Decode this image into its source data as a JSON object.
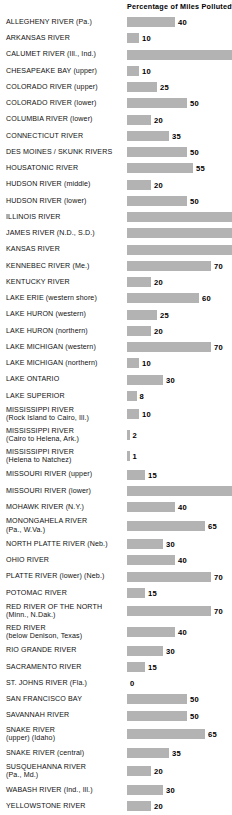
{
  "chart_data": {
    "type": "bar",
    "title": "Percentage of Miles Polluted",
    "title_footnote": "2",
    "orientation": "horizontal",
    "xlabel": "",
    "ylabel": "",
    "xlim": [
      0,
      100
    ],
    "grid": false,
    "legend": false,
    "value_unit": "percent",
    "categories": [
      "ALLEGHENY RIVER (Pa.)",
      "ARKANSAS RIVER",
      "CALUMET RIVER (Ill., Ind.)",
      "CHESAPEAKE BAY (upper)",
      "COLORADO RIVER (upper)",
      "COLORADO RIVER (lower)",
      "COLUMBIA RIVER (lower)",
      "CONNECTICUT RIVER",
      "DES MOINES / SKUNK RIVERS",
      "HOUSATONIC RIVER",
      "HUDSON RIVER (middle)",
      "HUDSON RIVER (lower)",
      "ILLINOIS RIVER",
      "JAMES RIVER (N.D., S.D.)",
      "KANSAS RIVER",
      "KENNEBEC RIVER (Me.)",
      "KENTUCKY RIVER",
      "LAKE ERIE (western shore)",
      "LAKE HURON (western)",
      "LAKE HURON (northern)",
      "LAKE MICHIGAN (western)",
      "LAKE MICHIGAN (northern)",
      "LAKE ONTARIO",
      "LAKE SUPERIOR",
      "MISSISSIPPI RIVER\n(Rock Island to Cairo, Ill.)",
      "MISSISSIPPI RIVER\n(Cairo to Helena, Ark.)",
      "MISSISSIPPI RIVER\n(Helena to Natchez)",
      "MISSOURI RIVER (upper)",
      "MISSOURI RIVER (lower)",
      "MOHAWK RIVER (N.Y.)",
      "MONONGAHELA RIVER\n(Pa., W.Va.)",
      "NORTH PLATTE RIVER (Neb.)",
      "OHIO RIVER",
      "PLATTE RIVER (lower) (Neb.)",
      "POTOMAC RIVER",
      "RED RIVER OF THE NORTH\n(Minn., N.Dak.)",
      "RED RIVER\n(below Denison, Texas)",
      "RIO GRANDE RIVER",
      "SACRAMENTO RIVER",
      "ST. JOHNS RIVER (Fla.)",
      "SAN FRANCISCO BAY",
      "SAVANNAH RIVER",
      "SNAKE RIVER\n(upper) (Idaho)",
      "SNAKE RIVER (central)",
      "SUSQUEHANNA RIVER\n(Pa., Md.)",
      "WABASH RIVER (Ind., Ill.)",
      "YELLOWSTONE RIVER"
    ],
    "values": [
      40,
      10,
      100,
      10,
      25,
      50,
      20,
      35,
      50,
      55,
      20,
      50,
      100,
      100,
      100,
      70,
      20,
      60,
      25,
      20,
      70,
      10,
      30,
      8,
      10,
      2,
      1,
      15,
      100,
      40,
      65,
      30,
      40,
      70,
      15,
      70,
      40,
      30,
      15,
      0,
      50,
      50,
      65,
      35,
      20,
      30,
      20
    ],
    "value_labels": [
      "40",
      "10",
      "",
      "10",
      "25",
      "50",
      "20",
      "35",
      "50",
      "55",
      "20",
      "50",
      "",
      "",
      "",
      "70",
      "20",
      "60",
      "25",
      "20",
      "70",
      "10",
      "30",
      "8",
      "10",
      "2",
      "1",
      "15",
      "",
      "40",
      "65",
      "30",
      "40",
      "70",
      "15",
      "70",
      "40",
      "30",
      "15",
      "0",
      "50",
      "50",
      "65",
      "35",
      "20",
      "30",
      "20"
    ]
  },
  "style": {
    "bar_color": "#b3b3b3",
    "text_color": "#000000",
    "background": "#ffffff"
  }
}
